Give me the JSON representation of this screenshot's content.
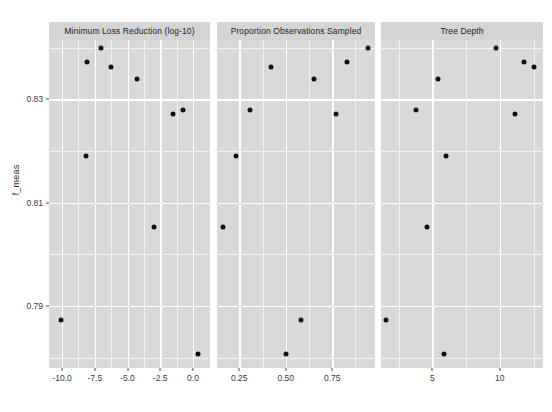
{
  "figure": {
    "width": 552,
    "height": 412,
    "background": "#ffffff",
    "panel_background": "#d9d9d9",
    "strip_background": "#d4d4d4",
    "gridline_color": "#ffffff",
    "point_color": "#111111",
    "bottom_caption": ""
  },
  "chart_data": {
    "type": "scatter",
    "title": "",
    "subtitle": "",
    "ylabel": "f_meas",
    "xlabel": "",
    "grid": true,
    "legend": "none",
    "ylim": [
      0.778,
      0.8415
    ],
    "yticks": [
      0.79,
      0.81,
      0.83
    ],
    "ytick_labels": [
      "0.79",
      "0.81",
      "0.83"
    ],
    "panels": [
      {
        "label": "Minimum Loss Reduction (log-10)",
        "xlabel": "Minimum Loss Reduction (log-10)",
        "xlim": [
          -11.0,
          1.3
        ],
        "xticks": [
          -10.0,
          -7.5,
          -5.0,
          -2.5,
          0.0
        ],
        "xtick_labels": [
          "-10.0",
          "-7.5",
          "-5.0",
          "-2.5",
          "0.0"
        ],
        "x_minor_ticks": [
          -8.75,
          -6.25,
          -3.75,
          -1.25
        ],
        "points": [
          {
            "x": -7.0,
            "y": 0.84
          },
          {
            "x": -8.1,
            "y": 0.8372
          },
          {
            "x": -6.3,
            "y": 0.8362
          },
          {
            "x": -4.3,
            "y": 0.834
          },
          {
            "x": -1.5,
            "y": 0.8272
          },
          {
            "x": -0.8,
            "y": 0.828
          },
          {
            "x": -8.2,
            "y": 0.819
          },
          {
            "x": -3.0,
            "y": 0.8053
          },
          {
            "x": -10.1,
            "y": 0.7873
          },
          {
            "x": 0.4,
            "y": 0.7808
          }
        ]
      },
      {
        "label": "Proportion Observations Sampled",
        "xlabel": "Proportion Observations Sampled",
        "xlim": [
          0.13,
          0.98
        ],
        "xticks": [
          0.25,
          0.5,
          0.75
        ],
        "xtick_labels": [
          "0.25",
          "0.50",
          "0.75"
        ],
        "x_minor_ticks": [
          0.375,
          0.625,
          0.875
        ],
        "points": [
          {
            "x": 0.94,
            "y": 0.84
          },
          {
            "x": 0.83,
            "y": 0.8372
          },
          {
            "x": 0.42,
            "y": 0.8362
          },
          {
            "x": 0.65,
            "y": 0.834
          },
          {
            "x": 0.77,
            "y": 0.8272
          },
          {
            "x": 0.31,
            "y": 0.828
          },
          {
            "x": 0.23,
            "y": 0.819
          },
          {
            "x": 0.16,
            "y": 0.8053
          },
          {
            "x": 0.58,
            "y": 0.7873
          },
          {
            "x": 0.5,
            "y": 0.7808
          }
        ]
      },
      {
        "label": "Tree Depth",
        "xlabel": "Tree Depth",
        "xlim": [
          1.2,
          13.2
        ],
        "xticks": [
          5,
          10
        ],
        "xtick_labels": [
          "5",
          "10"
        ],
        "x_minor_ticks": [
          2.5,
          7.5,
          12.5
        ],
        "points": [
          {
            "x": 9.7,
            "y": 0.84
          },
          {
            "x": 11.8,
            "y": 0.8372
          },
          {
            "x": 12.5,
            "y": 0.8362
          },
          {
            "x": 5.4,
            "y": 0.834
          },
          {
            "x": 11.1,
            "y": 0.8272
          },
          {
            "x": 3.8,
            "y": 0.828
          },
          {
            "x": 6.0,
            "y": 0.819
          },
          {
            "x": 4.6,
            "y": 0.8053
          },
          {
            "x": 1.6,
            "y": 0.7873
          },
          {
            "x": 5.9,
            "y": 0.7808
          }
        ]
      }
    ]
  }
}
